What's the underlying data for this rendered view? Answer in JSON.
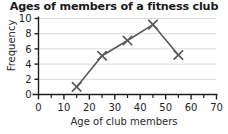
{
  "chart_data": {
    "type": "line",
    "title": "Ages of members of a fitness club",
    "xlabel": "Age of club members",
    "ylabel": "Frequency",
    "x": [
      15,
      25,
      35,
      45,
      55
    ],
    "values": [
      1,
      5.1,
      7.1,
      9.2,
      5.2
    ],
    "series": [
      {
        "name": "Frequency",
        "x": [
          15,
          25,
          35,
          45,
          55
        ],
        "values": [
          1,
          5.1,
          7.1,
          9.2,
          5.2
        ]
      }
    ],
    "xlim": [
      0,
      70
    ],
    "ylim": [
      0,
      10
    ],
    "xticks": [
      0,
      10,
      20,
      30,
      40,
      50,
      60,
      70
    ],
    "yticks": [
      0,
      2,
      4,
      6,
      8,
      10
    ],
    "xtick_labels": [
      "0",
      "10",
      "20",
      "30",
      "40",
      "50",
      "60",
      "70"
    ],
    "ytick_labels": [
      "0",
      "2",
      "4",
      "6",
      "8",
      "10"
    ],
    "x_minor_tick_step": 5,
    "grid": true,
    "grid_axis": "y",
    "legend": false,
    "marker": "x",
    "line_color": "#5a5a5a",
    "marker_color": "#5a5a5a",
    "grid_color": "#d9d9d9",
    "axis_color": "#1f1f1f",
    "background": "#ffffff"
  }
}
